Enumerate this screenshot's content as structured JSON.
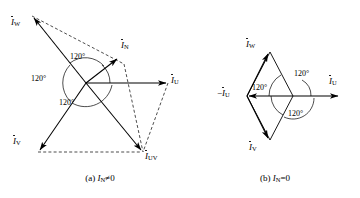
{
  "figure": {
    "background_color": "#ffffff",
    "line_color": "#000000",
    "panels": [
      {
        "id": "a",
        "caption_prefix": "(a)",
        "caption_symbol": "I",
        "caption_subscript": "N",
        "caption_relation": "≠0",
        "caption_full": "(a) İN ≠ 0",
        "origin": {
          "x": 86,
          "y": 83
        },
        "phasors": [
          {
            "name": "I_U",
            "label_symbol": "I",
            "label_subscript": "U",
            "angle_deg": 0,
            "style": "solid",
            "tip": {
              "x": 168,
              "y": 83
            },
            "label_pos": {
              "x": 172,
              "y": 79
            }
          },
          {
            "name": "I_W",
            "label_symbol": "I",
            "label_subscript": "W",
            "angle_deg": 132,
            "style": "solid",
            "tip": {
              "x": 32,
              "y": 16
            },
            "label_pos": {
              "x": 12,
              "y": 22
            }
          },
          {
            "name": "I_V",
            "label_symbol": "I",
            "label_subscript": "V",
            "angle_deg": 228,
            "style": "solid",
            "tip": {
              "x": 38,
              "y": 152
            },
            "label_pos": {
              "x": 14,
              "y": 140
            }
          },
          {
            "name": "I_N",
            "label_symbol": "I",
            "label_subscript": "N",
            "angle_deg": 37,
            "style": "solid",
            "tip": {
              "x": 119,
              "y": 57
            },
            "label_pos": {
              "x": 122,
              "y": 44
            }
          },
          {
            "name": "I_UV",
            "label_symbol": "I",
            "label_subscript": "UV",
            "angle_deg": 310,
            "style": "solid",
            "tip": {
              "x": 143,
              "y": 152
            },
            "label_pos": {
              "x": 146,
              "y": 152
            }
          }
        ],
        "construction_lines": [
          {
            "name": "dash-w-to-n",
            "from": {
              "x": 32,
              "y": 16
            },
            "to": {
              "x": 123,
              "y": 63
            }
          },
          {
            "name": "dash-n-to-uv",
            "from": {
              "x": 123,
              "y": 63
            },
            "to": {
              "x": 143,
              "y": 152
            }
          },
          {
            "name": "dash-u-to-uv",
            "from": {
              "x": 168,
              "y": 83
            },
            "to": {
              "x": 143,
              "y": 152
            }
          },
          {
            "name": "dash-v-to-uv",
            "from": {
              "x": 38,
              "y": 152
            },
            "to": {
              "x": 143,
              "y": 152
            }
          }
        ],
        "angle_labels": [
          {
            "value": "120°",
            "pos": {
              "x": 72,
              "y": 57
            }
          },
          {
            "value": "120°",
            "pos": {
              "x": 34,
              "y": 79
            }
          },
          {
            "value": "120°",
            "pos": {
              "x": 62,
              "y": 103
            }
          }
        ]
      },
      {
        "id": "b",
        "caption_prefix": "(b)",
        "caption_symbol": "I",
        "caption_subscript": "N",
        "caption_relation": "=0",
        "caption_full": "(b) İN = 0",
        "origin": {
          "x": 293,
          "y": 96
        },
        "phasors": [
          {
            "name": "I_U",
            "label_symbol": "I",
            "label_subscript": "U",
            "angle_deg": 0,
            "style": "solid",
            "tip": {
              "x": 340,
              "y": 96
            },
            "label_pos": {
              "x": 330,
              "y": 78
            }
          },
          {
            "name": "minus_I_U",
            "label_symbol": "I",
            "label_subscript": "U",
            "label_sign": "−",
            "angle_deg": 180,
            "style": "solid",
            "tip": {
              "x": 247,
              "y": 96
            },
            "label_pos": {
              "x": 218,
              "y": 90
            }
          },
          {
            "name": "I_W",
            "label_symbol": "I",
            "label_subscript": "W",
            "angle_deg": 60,
            "style": "solid",
            "tip": {
              "x": 270,
              "y": 52
            },
            "label_pos": {
              "x": 248,
              "y": 44
            }
          },
          {
            "name": "I_V",
            "label_symbol": "I",
            "label_subscript": "V",
            "angle_deg": 300,
            "style": "solid",
            "tip": {
              "x": 270,
              "y": 140
            },
            "label_pos": {
              "x": 250,
              "y": 146
            }
          }
        ],
        "construction_lines": [
          {
            "name": "edge-minusU-to-W",
            "from": {
              "x": 247,
              "y": 96
            },
            "to": {
              "x": 270,
              "y": 52
            }
          },
          {
            "name": "edge-W-to-U-tip",
            "from": {
              "x": 270,
              "y": 52
            },
            "to": {
              "x": 293,
              "y": 96
            }
          },
          {
            "name": "edge-minusU-to-V",
            "from": {
              "x": 247,
              "y": 96
            },
            "to": {
              "x": 270,
              "y": 140
            }
          },
          {
            "name": "edge-V-to-U-tip",
            "from": {
              "x": 270,
              "y": 140
            },
            "to": {
              "x": 293,
              "y": 96
            }
          }
        ],
        "angle_labels": [
          {
            "value": "120°",
            "pos": {
              "x": 255,
              "y": 88
            }
          },
          {
            "value": "120°",
            "pos": {
              "x": 296,
              "y": 74
            }
          },
          {
            "value": "120°",
            "pos": {
              "x": 291,
              "y": 113
            }
          }
        ]
      }
    ]
  }
}
